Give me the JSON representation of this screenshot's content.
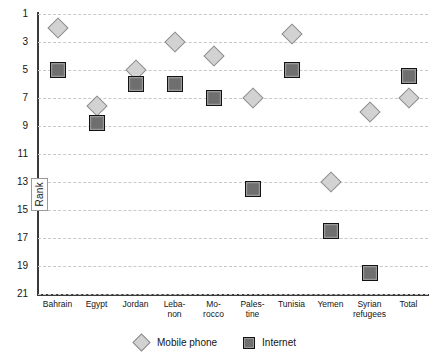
{
  "chart_data": {
    "type": "scatter",
    "title": "",
    "xlabel": "",
    "ylabel": "Rank",
    "ylim": [
      1,
      21
    ],
    "y_inverted": true,
    "grid": true,
    "legend_position": "bottom-center",
    "ytick_labels": [
      "1",
      "3",
      "5",
      "7",
      "9",
      "11",
      "13",
      "15",
      "17",
      "19",
      "21"
    ],
    "ytick_values": [
      1,
      3,
      5,
      7,
      9,
      11,
      13,
      15,
      17,
      19,
      21
    ],
    "categories": [
      "Bahrain",
      "Egypt",
      "Jordan",
      "Leba-\nnon",
      "Mo-\nrocco",
      "Pales-\ntine",
      "Tunisia",
      "Yemen",
      "Syrian\nrefugees",
      "Total"
    ],
    "category_lines": [
      [
        "Bahrain"
      ],
      [
        "Egypt"
      ],
      [
        "Jordan"
      ],
      [
        "Leba-",
        "non"
      ],
      [
        "Mo-",
        "rocco"
      ],
      [
        "Pales-",
        "tine"
      ],
      [
        "Tunisia"
      ],
      [
        "Yemen"
      ],
      [
        "Syrian",
        "refugees"
      ],
      [
        "Total"
      ]
    ],
    "series": [
      {
        "name": "Mobile phone",
        "marker": "diamond",
        "color": "#d2d2d2",
        "edge_color": "#8c8c8c",
        "values": [
          2,
          7.6,
          5,
          3,
          4,
          7,
          2.4,
          13,
          8,
          7
        ]
      },
      {
        "name": "Internet",
        "marker": "square",
        "color": "#6f6f6f",
        "edge_color": "#121212",
        "values": [
          5,
          8.8,
          6,
          6,
          7,
          13.5,
          5,
          16.5,
          19.5,
          5.4
        ]
      }
    ]
  },
  "legend": {
    "items": [
      {
        "label": "Mobile phone",
        "icon": "diamond-marker-icon"
      },
      {
        "label": "Internet",
        "icon": "square-marker-icon"
      }
    ]
  },
  "axis": {
    "y_title": "Rank"
  },
  "colors": {
    "mobile_phone": "#d2d2d2",
    "internet": "#6f6f6f",
    "grid": "#c9c9c9",
    "axis": "#3a3a3a",
    "background": "#ffffff"
  }
}
